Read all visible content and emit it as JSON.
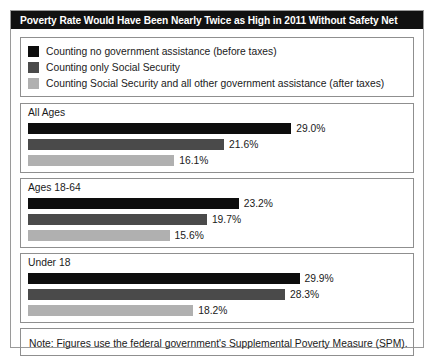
{
  "title": "Poverty Rate Would Have Been Nearly Twice as High in 2011 Without Safety Net",
  "note": "Note: Figures use the federal government's Supplemental Poverty Measure (SPM).",
  "colors": {
    "series_1": "#0d0d0d",
    "series_2": "#4a4a4a",
    "series_3": "#b0b0b0",
    "title_bar_bg": "#111111",
    "title_bar_text": "#ffffff",
    "border": "#8f8f8f",
    "background": "#ffffff"
  },
  "legend": {
    "items": [
      {
        "label": "Counting no government assistance (before taxes)",
        "color": "#0d0d0d"
      },
      {
        "label": "Counting only Social Security",
        "color": "#4a4a4a"
      },
      {
        "label": "Counting Social Security and all other government assistance (after taxes)",
        "color": "#b0b0b0"
      }
    ]
  },
  "chart_data": {
    "type": "bar",
    "orientation": "horizontal",
    "title": "Poverty Rate Would Have Been Nearly Twice as High in 2011 Without Safety Net",
    "xlabel": "",
    "ylabel": "",
    "xlim": [
      0,
      32
    ],
    "grid": false,
    "legend_position": "top",
    "categories": [
      "All Ages",
      "Ages 18-64",
      "Under 18"
    ],
    "series": [
      {
        "name": "Counting no government assistance (before taxes)",
        "color": "#0d0d0d",
        "values": [
          29.0,
          23.2,
          29.9
        ],
        "labels": [
          "29.0%",
          "23.2%",
          "29.9%"
        ]
      },
      {
        "name": "Counting only Social Security",
        "color": "#4a4a4a",
        "values": [
          21.6,
          19.7,
          28.3
        ],
        "labels": [
          "21.6%",
          "19.7%",
          "28.3%"
        ]
      },
      {
        "name": "Counting Social Security and all other government assistance (after taxes)",
        "color": "#b0b0b0",
        "values": [
          16.1,
          15.6,
          18.2
        ],
        "labels": [
          "16.1%",
          "15.6%",
          "18.2%"
        ]
      }
    ],
    "annotations": [
      "Note: Figures use the federal government's Supplemental Poverty Measure (SPM)."
    ]
  }
}
